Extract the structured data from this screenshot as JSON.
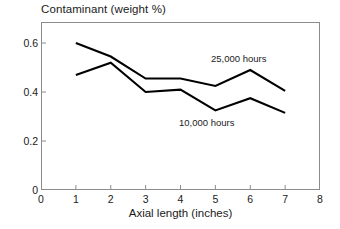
{
  "chart_data": {
    "type": "line",
    "title": "Contaminant (weight %)",
    "xlabel": "Axial length (inches)",
    "ylabel": "",
    "xlim": [
      0,
      8
    ],
    "ylim": [
      0,
      0.686
    ],
    "grid": false,
    "legend_position": "inline-annotation",
    "xticks": [
      "0",
      "1",
      "2",
      "3",
      "4",
      "5",
      "6",
      "7",
      "8"
    ],
    "xtick_values": [
      0,
      1,
      2,
      3,
      4,
      5,
      6,
      7,
      8
    ],
    "yticks": [
      "0",
      "0.2",
      "0.4",
      "0.6"
    ],
    "ytick_values": [
      0,
      0.2,
      0.4,
      0.6
    ],
    "x": [
      1,
      2,
      3,
      4,
      5,
      6,
      7
    ],
    "series": [
      {
        "name": "25,000 hours",
        "color": "#000000",
        "values": [
          0.6,
          0.545,
          0.455,
          0.455,
          0.425,
          0.49,
          0.405
        ]
      },
      {
        "name": "10,000 hours",
        "color": "#000000",
        "values": [
          0.47,
          0.52,
          0.4,
          0.41,
          0.325,
          0.375,
          0.315
        ]
      }
    ],
    "annotations": [
      {
        "text": "25,000 hours",
        "series": "25,000 hours"
      },
      {
        "text": "10,000 hours",
        "series": "10,000 hours"
      }
    ]
  },
  "colors": {
    "line": "#000000",
    "axis": "#8c8c8c",
    "text": "#1a1a1a",
    "background": "#ffffff"
  }
}
